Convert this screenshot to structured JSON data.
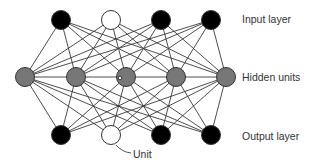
{
  "diagram": {
    "type": "neural-network",
    "colors": {
      "black_unit": "#000000",
      "white_unit": "#ffffff",
      "hidden_unit": "#777777",
      "edge": "#3a3a3a",
      "text": "#333333"
    },
    "layers": [
      {
        "name": "input",
        "label": "Input layer",
        "y": 20,
        "units": [
          {
            "x": 61,
            "fill": "black"
          },
          {
            "x": 111,
            "fill": "white"
          },
          {
            "x": 161,
            "fill": "black"
          },
          {
            "x": 211,
            "fill": "black"
          }
        ]
      },
      {
        "name": "hidden",
        "label": "Hidden units",
        "y": 77,
        "units": [
          {
            "x": 25,
            "fill": "gray"
          },
          {
            "x": 76,
            "fill": "gray"
          },
          {
            "x": 126,
            "fill": "gray"
          },
          {
            "x": 176,
            "fill": "gray"
          },
          {
            "x": 226,
            "fill": "gray"
          }
        ]
      },
      {
        "name": "output",
        "label": "Output layer",
        "y": 135,
        "units": [
          {
            "x": 61,
            "fill": "black"
          },
          {
            "x": 111,
            "fill": "white"
          },
          {
            "x": 161,
            "fill": "black"
          },
          {
            "x": 211,
            "fill": "black"
          }
        ]
      }
    ],
    "annotation": {
      "label": "Unit",
      "points_to": "output unit 2"
    }
  }
}
